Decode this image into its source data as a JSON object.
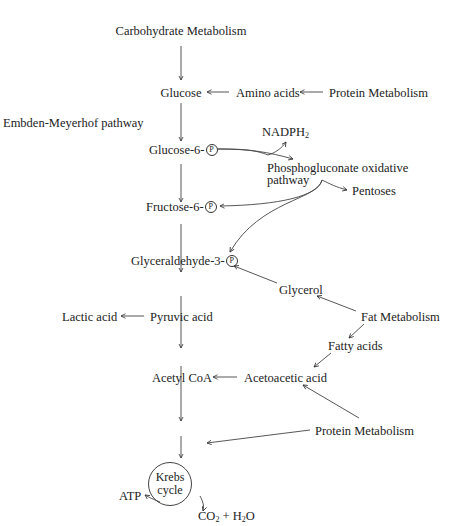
{
  "diagram": {
    "title": "Carbohydrate Metabolism",
    "side_label": "Embden-Meyerhof pathway",
    "nodes": {
      "carb": "Carbohydrate Metabolism",
      "glucose": "Glucose",
      "amino": "Amino acids",
      "protein_top": "Protein Metabolism",
      "g6p": "Glucose-6-",
      "nadph": "NADPH",
      "nadph_sub": "2",
      "phospho_line1": "Phosphogluconate oxidative",
      "phospho_line2": "pathway",
      "pentoses": "Pentoses",
      "f6p": "Fructose-6-",
      "g3p": "Glyceraldehyde-3-",
      "glycerol": "Glycerol",
      "lactic": "Lactic acid",
      "pyruvic": "Pyruvic acid",
      "fat": "Fat Metabolism",
      "fatty": "Fatty acids",
      "acetylcoa": "Acetyl CoA",
      "acetoacetic": "Acetoacetic acid",
      "protein_bottom": "Protein Metabolism",
      "krebs_line1": "Krebs",
      "krebs_line2": "cycle",
      "atp": "ATP",
      "co2": "CO",
      "co2_sub": "2",
      "plus": " + H",
      "h2o_sub": "2",
      "h2o_tail": "O",
      "phosphate_symbol": "P"
    }
  }
}
